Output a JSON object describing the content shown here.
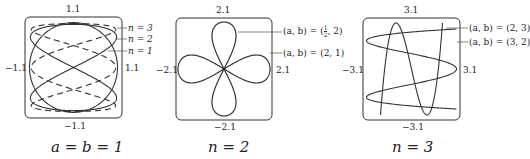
{
  "panels": [
    {
      "id": "a_eq_b_1",
      "caption": "a = b = 1",
      "ticks": {
        "top": "1.1",
        "bottom": "−1.1",
        "left": "−1.1",
        "right": "1.1"
      },
      "legend": [
        "n = 3",
        "n = 2",
        "n = 1"
      ]
    },
    {
      "id": "n_2",
      "caption": "n = 2",
      "ticks": {
        "top": "2.1",
        "bottom": "−2.1",
        "left": "−2.1",
        "right": "2.1"
      },
      "legend": [
        "(a, b) = (½, 2)",
        "(a, b) = (2, 1)"
      ],
      "legend_parts": {
        "first_prefix": "(a, b) = (",
        "first_num": "1",
        "first_den": "2",
        "first_suffix": ", 2)"
      }
    },
    {
      "id": "n_3",
      "caption": "n = 3",
      "ticks": {
        "top": "3.1",
        "bottom": "−3.1",
        "left": "−3.1",
        "right": "3.1"
      },
      "legend": [
        "(a, b) = (2, 3)",
        "(a, b) = (3, 2)"
      ]
    }
  ],
  "chart_data": [
    {
      "type": "line",
      "title": "a = b = 1",
      "xlim": [
        -1.1,
        1.1
      ],
      "ylim": [
        -1.1,
        1.1
      ],
      "series": [
        {
          "name": "n = 1",
          "style": "solid"
        },
        {
          "name": "n = 2",
          "style": "solid"
        },
        {
          "name": "n = 3",
          "style": "dashed"
        }
      ]
    },
    {
      "type": "line",
      "title": "n = 2",
      "xlim": [
        -2.1,
        2.1
      ],
      "ylim": [
        -2.1,
        2.1
      ],
      "series": [
        {
          "name": "(a, b) = (1/2, 2)",
          "style": "solid"
        },
        {
          "name": "(a, b) = (2, 1)",
          "style": "solid"
        }
      ]
    },
    {
      "type": "line",
      "title": "n = 3",
      "xlim": [
        -3.1,
        3.1
      ],
      "ylim": [
        -3.1,
        3.1
      ],
      "series": [
        {
          "name": "(a, b) = (2, 3)",
          "style": "solid"
        },
        {
          "name": "(a, b) = (3, 2)",
          "style": "solid"
        }
      ]
    }
  ]
}
